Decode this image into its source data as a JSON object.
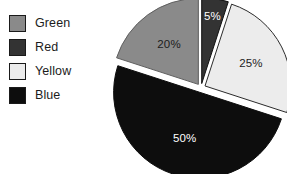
{
  "figure": {
    "background_color": "#ffffff",
    "title": ""
  },
  "legend": {
    "position": "left",
    "items": [
      {
        "label": "Green",
        "swatch_color": "#8a8a8a",
        "swatch_name": "legend-swatch-green"
      },
      {
        "label": "Red",
        "swatch_color": "#333333",
        "swatch_name": "legend-swatch-red"
      },
      {
        "label": "Yellow",
        "swatch_color": "#ececec",
        "swatch_name": "legend-swatch-yellow"
      },
      {
        "label": "Blue",
        "swatch_color": "#0d0d0d",
        "swatch_name": "legend-swatch-blue"
      }
    ]
  },
  "chart_data": {
    "type": "pie",
    "title": "",
    "xlabel": "",
    "ylabel": "",
    "exploded": true,
    "start_angle_deg": 0,
    "direction": "clockwise",
    "categories": [
      "Red",
      "Yellow",
      "Blue",
      "Green"
    ],
    "values": [
      5,
      25,
      50,
      20
    ],
    "labels": [
      "5%",
      "25%",
      "50%",
      "20%"
    ],
    "slices": [
      {
        "name": "Red",
        "value": 5,
        "label": "5%",
        "fill": "#333333",
        "stroke": "#111111",
        "label_color": "#ffffff",
        "start_deg": 0,
        "end_deg": 18
      },
      {
        "name": "Yellow",
        "value": 25,
        "label": "25%",
        "fill": "#ececec",
        "stroke": "#2b2b2b",
        "label_color": "#1c1c1c",
        "start_deg": 18,
        "end_deg": 108
      },
      {
        "name": "Blue",
        "value": 50,
        "label": "50%",
        "fill": "#0d0d0d",
        "stroke": "#0d0d0d",
        "label_color": "#ffffff",
        "start_deg": 108,
        "end_deg": 288
      },
      {
        "name": "Green",
        "value": 20,
        "label": "20%",
        "fill": "#8a8a8a",
        "stroke": "#5f5f5f",
        "label_color": "#1c1c1c",
        "start_deg": 288,
        "end_deg": 360
      }
    ],
    "total": 100,
    "units": "percent",
    "grid": false,
    "legend_position": "left"
  }
}
